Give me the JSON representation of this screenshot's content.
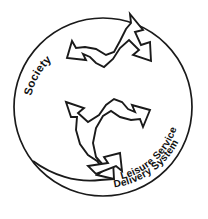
{
  "diagram": {
    "type": "circular-interaction-diagram",
    "background_color": "#ffffff",
    "stroke_color": "#1a1a1a",
    "fill_color": "#ffffff",
    "boundary": {
      "shape": "circle",
      "name": "society-boundary-circle",
      "center_x": 103,
      "center_y": 107,
      "radius": 89
    },
    "labels": {
      "society": "Society",
      "system_line_1": "Leisure Service",
      "system_line_2": "Delivery System"
    },
    "arrows": [
      {
        "name": "upper-reciprocal-arrow",
        "style": "double-headed-curved",
        "head_directions": [
          "upper-right",
          "left"
        ]
      },
      {
        "name": "lower-reciprocal-arrow",
        "style": "double-headed-curved",
        "head_directions": [
          "upper-left",
          "lower-right"
        ]
      }
    ]
  }
}
